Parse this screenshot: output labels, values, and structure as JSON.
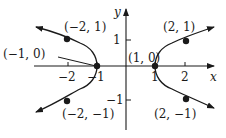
{
  "graph": {
    "equation_hint": "x^2 - 3y^2 = 1",
    "axes": {
      "x_label": "x",
      "y_label": "y"
    },
    "x_ticks": [
      {
        "value": -2,
        "label": "−2"
      },
      {
        "value": -1,
        "label": "−1"
      },
      {
        "value": 1,
        "label": "1"
      },
      {
        "value": 2,
        "label": "2"
      }
    ],
    "y_ticks": [
      {
        "value": 1,
        "label": "1"
      },
      {
        "value": -1,
        "label": "−1"
      }
    ],
    "points": [
      {
        "x": -2,
        "y": 1,
        "label": "(−2, 1)"
      },
      {
        "x": -1,
        "y": 0,
        "label": "(−1, 0)"
      },
      {
        "x": -2,
        "y": -1,
        "label": "(−2, −1)"
      },
      {
        "x": 2,
        "y": 1,
        "label": "(2, 1)"
      },
      {
        "x": 1,
        "y": 0,
        "label": "(1, 0)"
      },
      {
        "x": 2,
        "y": -1,
        "label": "(2, −1)"
      }
    ],
    "colors": {
      "stroke": "#1a1a1a",
      "background": "#ffffff"
    }
  }
}
